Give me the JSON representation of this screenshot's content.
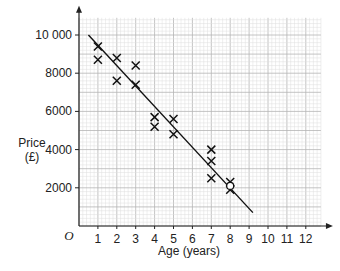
{
  "chart_data": {
    "type": "scatter",
    "title": "",
    "xlabel": "Age (years)",
    "ylabel": "Price (£)",
    "ylabel_lines": [
      "Price",
      "(£)"
    ],
    "origin_label": "O",
    "xlim": [
      0,
      12.8
    ],
    "ylim": [
      0,
      10900
    ],
    "x_ticks": [
      1,
      2,
      3,
      4,
      5,
      6,
      7,
      8,
      9,
      10,
      11,
      12
    ],
    "y_ticks": [
      2000,
      4000,
      6000,
      8000,
      10000
    ],
    "y_tick_labels": [
      "2000",
      "4000",
      "6000",
      "8000",
      "10 000"
    ],
    "grid": true,
    "points": [
      {
        "x": 1,
        "y": 9400
      },
      {
        "x": 1,
        "y": 8700
      },
      {
        "x": 2,
        "y": 8800
      },
      {
        "x": 2,
        "y": 7600
      },
      {
        "x": 3,
        "y": 8400
      },
      {
        "x": 3,
        "y": 7400
      },
      {
        "x": 4,
        "y": 5700
      },
      {
        "x": 4,
        "y": 5200
      },
      {
        "x": 5,
        "y": 5600
      },
      {
        "x": 5,
        "y": 4800
      },
      {
        "x": 7,
        "y": 4000
      },
      {
        "x": 7,
        "y": 3400
      },
      {
        "x": 7,
        "y": 2500
      },
      {
        "x": 8,
        "y": 2300
      },
      {
        "x": 8,
        "y": 1900
      }
    ],
    "best_fit_line": {
      "x1": 0.5,
      "y1": 10000,
      "x2": 9.2,
      "y2": 700
    },
    "highlight_circle": {
      "x": 8,
      "y": 2100
    },
    "marker": "x"
  }
}
